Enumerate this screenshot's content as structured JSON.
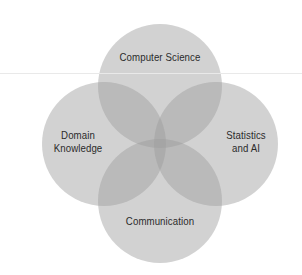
{
  "figure": {
    "type": "venn-diagram",
    "shape": "four-overlapping-circles",
    "background_color": "#ffffff",
    "circle_fill_color": "#9e9e9e",
    "circle_opacity": 0.55,
    "label_color": "#2b2b2b",
    "artifact_rule_color": "#e9e9e9",
    "artifact_rule_y": 73
  },
  "chart_data": {
    "type": "venn",
    "title": "",
    "sets": [
      {
        "id": "computer-science",
        "label": "Computer Science",
        "position": "top",
        "center": [
          160,
          86
        ],
        "radius": 62
      },
      {
        "id": "domain-knowledge",
        "label": "Domain\nKnowledge",
        "position": "left",
        "center": [
          104,
          144
        ],
        "radius": 62
      },
      {
        "id": "statistics-and-ai",
        "label": "Statistics\nand AI",
        "position": "right",
        "center": [
          216,
          144
        ],
        "radius": 62
      },
      {
        "id": "communication",
        "label": "Communication",
        "position": "bottom",
        "center": [
          160,
          201
        ],
        "radius": 62
      }
    ],
    "intersection": {
      "label": "",
      "center": [
        160,
        144
      ],
      "description": "central four-way overlap"
    }
  },
  "labels": {
    "computer_science": "Computer Science",
    "domain_knowledge": "Domain\nKnowledge",
    "statistics_and_ai": "Statistics\nand AI",
    "communication": "Communication"
  }
}
